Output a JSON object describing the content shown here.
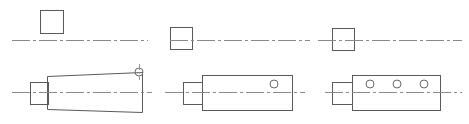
{
  "drawing": {
    "title": "Three-view shaft end detail comparison",
    "background_color": "#ffffff",
    "line_color": "#5a5a5a",
    "centerline_color": "#8a8a8a",
    "hole_color": "#6a6a6a",
    "width": 469,
    "height": 124,
    "panel_count": 3,
    "panels": [
      {
        "id": "panel-1",
        "label": "Variant A - tapered body with corner hole",
        "top_view": {
          "shape": "square",
          "x": 40,
          "y": 10,
          "width": 23,
          "height": 23,
          "position_relative_to_axis": "above",
          "touches_centerline": false
        },
        "centerline": {
          "y": 40,
          "x_start": 12,
          "x_end": 148,
          "style": "dash-dot"
        },
        "side_view": {
          "axis_y": 92,
          "step": {
            "x": 30,
            "y": 82,
            "width": 18,
            "height": 22
          },
          "body": {
            "x_left": 47,
            "x_right": 142,
            "y_top_left": 76,
            "y_top_right": 72,
            "y_bottom_left": 109,
            "y_bottom_right": 112,
            "taper": true
          },
          "holes": [
            {
              "cx": 139,
              "cy": 72,
              "r": 4,
              "note": "corner hole on upper right edge"
            }
          ],
          "hole_count": 1
        }
      },
      {
        "id": "panel-2",
        "label": "Variant B - straight body with single hole",
        "top_view": {
          "shape": "square",
          "x": 170,
          "y": 27,
          "width": 22,
          "height": 22,
          "position_relative_to_axis": "centered",
          "touches_centerline": true
        },
        "centerline": {
          "y": 40,
          "x_start": 170,
          "x_end": 310,
          "style": "dash-dot"
        },
        "side_view": {
          "axis_y": 92,
          "step": {
            "x": 183,
            "y": 82,
            "width": 19,
            "height": 22
          },
          "body": {
            "x_left": 202,
            "x_right": 292,
            "y_top_left": 75,
            "y_top_right": 75,
            "y_bottom_left": 110,
            "y_bottom_right": 110,
            "taper": false
          },
          "holes": [
            {
              "cx": 274,
              "cy": 84,
              "r": 4,
              "note": "single hole near right end"
            }
          ],
          "hole_count": 1
        }
      },
      {
        "id": "panel-3",
        "label": "Variant C - straight body with three holes",
        "top_view": {
          "shape": "square",
          "x": 332,
          "y": 28,
          "width": 22,
          "height": 22,
          "position_relative_to_axis": "centered",
          "touches_centerline": true
        },
        "centerline": {
          "y": 40,
          "x_start": 318,
          "x_end": 462,
          "style": "dash-dot"
        },
        "side_view": {
          "axis_y": 92,
          "step": {
            "x": 332,
            "y": 82,
            "width": 20,
            "height": 22
          },
          "body": {
            "x_left": 352,
            "x_right": 440,
            "y_top_left": 75,
            "y_top_right": 75,
            "y_bottom_left": 110,
            "y_bottom_right": 110,
            "taper": false
          },
          "holes": [
            {
              "cx": 370,
              "cy": 84,
              "r": 4,
              "note": "left hole"
            },
            {
              "cx": 397,
              "cy": 84,
              "r": 4,
              "note": "center hole"
            },
            {
              "cx": 424,
              "cy": 84,
              "r": 4,
              "note": "right hole"
            }
          ],
          "hole_count": 3
        }
      }
    ]
  }
}
